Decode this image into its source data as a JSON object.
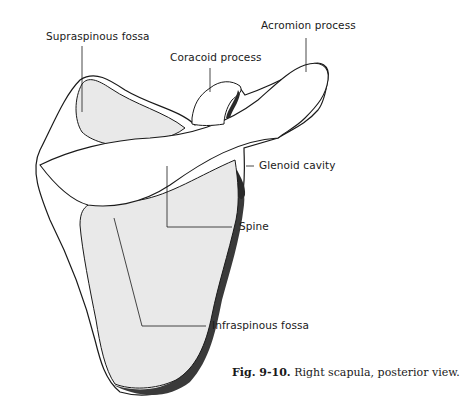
{
  "figure": {
    "number": "Fig. 9-10.",
    "caption": "Right scapula, posterior view.",
    "subject": "Right scapula",
    "view": "posterior"
  },
  "labels": [
    {
      "id": "supraspinous-fossa",
      "text": "Supraspinous fossa"
    },
    {
      "id": "coracoid-process",
      "text": "Coracoid process"
    },
    {
      "id": "acromion-process",
      "text": "Acromion process"
    },
    {
      "id": "glenoid-cavity",
      "text": "Glenoid cavity"
    },
    {
      "id": "spine",
      "text": "Spine"
    },
    {
      "id": "infraspinous-fossa",
      "text": "Infraspinous fossa"
    }
  ],
  "colors": {
    "outline": "#1a1a1a",
    "fossa_fill": "#e9e9e9",
    "dark_edge": "#3a3a3a",
    "background": "#ffffff"
  }
}
